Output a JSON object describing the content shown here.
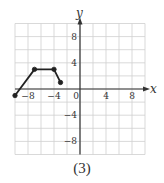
{
  "caption": "(3)",
  "chart_data": {
    "type": "line",
    "title": "",
    "xlabel": "x",
    "ylabel": "y",
    "xlim": [
      -10,
      10
    ],
    "ylim": [
      -10,
      10
    ],
    "grid": true,
    "grid_step": 2,
    "x_ticks": [
      {
        "value": -8,
        "label": "−8"
      },
      {
        "value": -4,
        "label": "−4"
      },
      {
        "value": 0,
        "label": "0"
      },
      {
        "value": 4,
        "label": "4"
      },
      {
        "value": 8,
        "label": "8"
      }
    ],
    "y_ticks": [
      {
        "value": 8,
        "label": "8"
      },
      {
        "value": 4,
        "label": "4"
      },
      {
        "value": -4,
        "label": "−4"
      },
      {
        "value": -8,
        "label": "−8"
      }
    ],
    "series": [
      {
        "name": "graph",
        "points": [
          [
            -10,
            -1
          ],
          [
            -7,
            3
          ],
          [
            -4,
            3
          ],
          [
            -3,
            1
          ]
        ],
        "closed_endpoints": [
          true,
          true,
          true,
          true
        ]
      }
    ],
    "colors": {
      "grid": "#cfcfcf",
      "axis": "#333333",
      "line": "#222222"
    }
  }
}
